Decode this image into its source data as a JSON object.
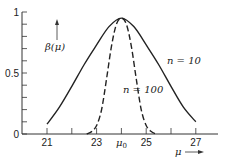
{
  "chart_data": {
    "type": "line",
    "title": "",
    "xlabel": "μ",
    "ylabel": "β(μ)",
    "xlim": [
      20.4,
      27.9
    ],
    "ylim": [
      0,
      1
    ],
    "grid": false,
    "legend": "inline labels",
    "x_ticks": [
      {
        "value": 21,
        "label": "21"
      },
      {
        "value": 22,
        "label": ""
      },
      {
        "value": 23,
        "label": "23"
      },
      {
        "value": 24,
        "label": "μ0"
      },
      {
        "value": 25,
        "label": "25"
      },
      {
        "value": 26,
        "label": ""
      },
      {
        "value": 27,
        "label": "27"
      }
    ],
    "y_ticks": [
      {
        "value": 0,
        "label": "0"
      },
      {
        "value": 0.1,
        "label": ""
      },
      {
        "value": 0.2,
        "label": ""
      },
      {
        "value": 0.3,
        "label": ""
      },
      {
        "value": 0.4,
        "label": ""
      },
      {
        "value": 0.5,
        "label": "0.5"
      },
      {
        "value": 0.6,
        "label": ""
      },
      {
        "value": 0.7,
        "label": ""
      },
      {
        "value": 0.8,
        "label": ""
      },
      {
        "value": 0.9,
        "label": ""
      },
      {
        "value": 1,
        "label": "1"
      }
    ],
    "series": [
      {
        "name": "n = 10",
        "style": "solid",
        "x": [
          21,
          21.5,
          22,
          22.5,
          23,
          23.5,
          24,
          24.5,
          25,
          25.5,
          26,
          26.5,
          27
        ],
        "values": [
          0.08,
          0.22,
          0.39,
          0.57,
          0.73,
          0.88,
          0.95,
          0.88,
          0.73,
          0.57,
          0.39,
          0.22,
          0.1
        ]
      },
      {
        "name": "n = 100",
        "style": "dashed",
        "x": [
          22.6,
          22.8,
          23,
          23.2,
          23.4,
          23.6,
          23.8,
          24,
          24.2,
          24.4,
          24.6,
          24.8,
          25,
          25.2,
          25.4
        ],
        "values": [
          0.0,
          0.02,
          0.07,
          0.2,
          0.45,
          0.72,
          0.9,
          0.95,
          0.9,
          0.72,
          0.45,
          0.2,
          0.07,
          0.02,
          0.0
        ]
      }
    ],
    "annotations": [
      {
        "text": "n = 10",
        "x": 25.8,
        "y": 0.6
      },
      {
        "text": "n = 100",
        "x": 24.1,
        "y": 0.36
      }
    ]
  },
  "labels": {
    "y_axis": "β(μ)",
    "x_axis": "μ",
    "series_solid": "n = 10",
    "series_dashed": "n = 100",
    "mu0": "μ",
    "mu0_sub": "0"
  }
}
